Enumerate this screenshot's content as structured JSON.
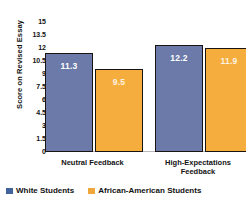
{
  "chart_data": {
    "type": "bar",
    "title": "",
    "xlabel": "",
    "ylabel": "Score on Revised Essay",
    "ylim": [
      0,
      15
    ],
    "yticks": [
      "15",
      "13.5",
      "12",
      "10.5",
      "9",
      "7.5",
      "6",
      "4.5",
      "3",
      "1.5",
      "0"
    ],
    "grid": false,
    "legend_position": "bottom",
    "categories": [
      "Neutral Feedback",
      "High-Expectations Feedback"
    ],
    "series": [
      {
        "name": "White Students",
        "color": "#6b7aa8",
        "values": [
          11.3,
          12.2
        ],
        "labels": [
          "11.3",
          "12.2"
        ]
      },
      {
        "name": "African-American Students",
        "color": "#f5ae3e",
        "values": [
          9.5,
          11.9
        ],
        "labels": [
          "9.5",
          "11.9"
        ]
      }
    ]
  },
  "axis": {
    "y_title": "Score on Revised Essay"
  },
  "categories": [
    {
      "line1": "Neutral Feedback",
      "line2": ""
    },
    {
      "line1": "High-Expectations",
      "line2": "Feedback"
    }
  ],
  "legend": [
    {
      "label": "White Students"
    },
    {
      "label": "African-American Students"
    }
  ]
}
